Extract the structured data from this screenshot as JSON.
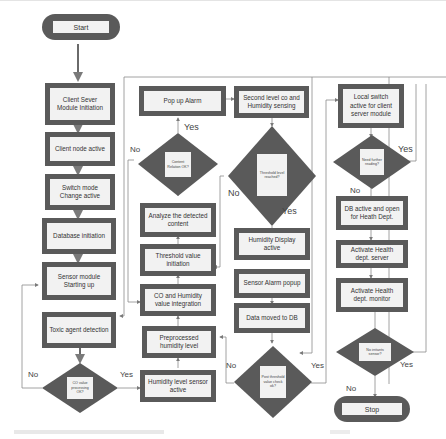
{
  "flowchart": {
    "start": "Start",
    "stop": "Stop",
    "col1": [
      "Client Sever Module Initiation",
      "Client node active",
      "Switch mode Change active",
      "Database initiation",
      "Sensor module Starting up",
      "Toxic agent detection"
    ],
    "col1_decision": "CO value processing OK?",
    "col2": {
      "popup_alarm": "Pop up Alarm",
      "content_decision": "Content Relation OK?",
      "analyze": "Analyze the detected content",
      "threshold_init": "Threshold value initiation",
      "co_humidity_integration": "CO and Humidity value integration",
      "preprocessed_humidity": "Preprocessed humidity level",
      "humidity_sensor": "Humidity level sensor active"
    },
    "col3": {
      "second_level": "Second level co and Humidity sensing",
      "threshold_decision": "Threshold level reached?",
      "humidity_display": "Humidity Display active",
      "sensor_alarm": "Sensor Alarm popup",
      "data_moved": "Data moved to DB",
      "post_threshold_decision": "Post threshold value check ok?"
    },
    "col4": {
      "local_switch": "Local switch active for client server module",
      "need_reading_decision": "Need further reading?",
      "db_active": "DB active and open for Heath Dept.",
      "activate_server": "Activate Health dept. server",
      "activate_monitor": "Activate Health dept. monitor",
      "no_irritants_decision": "No irritants sensor?"
    },
    "labels": {
      "yes": "Yes",
      "no": "No"
    },
    "colors": {
      "box_border": "#5a5a5a",
      "box_fill": "#f2f2f2",
      "connector": "#8a8a8a"
    }
  }
}
